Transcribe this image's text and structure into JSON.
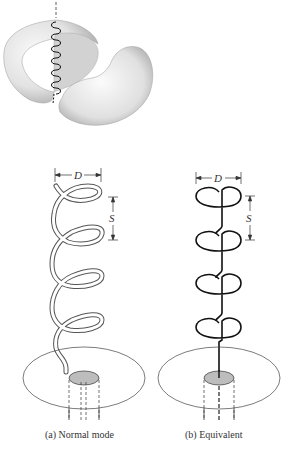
{
  "figure": {
    "panels": [
      {
        "id": "a",
        "caption": "(a)  Normal mode",
        "diameter_label": "D",
        "spacing_label": "S"
      },
      {
        "id": "b",
        "caption": "(b)  Equivalent",
        "diameter_label": "D",
        "spacing_label": "S"
      }
    ],
    "pattern_illustration": "doughnut radiation pattern with helix along axis",
    "colors": {
      "surface": "#e6e6e6",
      "line": "#222222",
      "feed": "#bdbdbd"
    }
  }
}
